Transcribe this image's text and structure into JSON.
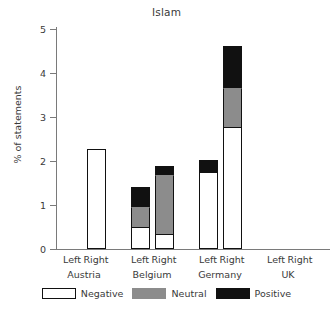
{
  "chart_data": {
    "type": "bar",
    "subtype": "stacked-bar-grouped",
    "title": "Islam",
    "xlabel": "",
    "ylabel": "% of statements",
    "ylim": [
      0,
      5
    ],
    "yticks": [
      0,
      1,
      2,
      3,
      4,
      5
    ],
    "ytick_labels": [
      "0",
      "1",
      "2",
      "3",
      "4",
      "5"
    ],
    "grid": false,
    "legend_position": "bottom",
    "categories": [
      "Austria Left",
      "Austria Right",
      "Belgium Left",
      "Belgium Right",
      "Germany Left",
      "Germany Right",
      "UK Left",
      "UK Right"
    ],
    "groups": [
      {
        "name": "Austria",
        "subcategories": [
          "Left",
          "Right"
        ]
      },
      {
        "name": "Belgium",
        "subcategories": [
          "Left",
          "Right"
        ]
      },
      {
        "name": "Germany",
        "subcategories": [
          "Left",
          "Right"
        ]
      },
      {
        "name": "UK",
        "subcategories": [
          "Left",
          "Right"
        ]
      }
    ],
    "series": [
      {
        "name": "Negative",
        "color": "#ffffff",
        "values": [
          0,
          2.27,
          0.5,
          0.34,
          1.75,
          2.77,
          0,
          0
        ]
      },
      {
        "name": "Neutral",
        "color": "#8c8c8c",
        "values": [
          0,
          0,
          0.45,
          1.35,
          0,
          0.9,
          0,
          0
        ]
      },
      {
        "name": "Positive",
        "color": "#111111",
        "values": [
          0,
          0,
          0.45,
          0.2,
          0.27,
          0.95,
          0,
          0
        ]
      }
    ],
    "totals": [
      0,
      2.27,
      1.4,
      1.89,
      2.02,
      4.62,
      0,
      0
    ]
  },
  "legend": {
    "items": [
      {
        "label": "Negative",
        "swatch": "white-swatch"
      },
      {
        "label": "Neutral",
        "swatch": "gray-swatch"
      },
      {
        "label": "Positive",
        "swatch": "black-swatch"
      }
    ]
  },
  "colors": {
    "negative": "#ffffff",
    "neutral": "#8c8c8c",
    "positive": "#111111",
    "axis": "#7a7a7a",
    "text": "#3a3a3a",
    "background": "#ffffff"
  }
}
